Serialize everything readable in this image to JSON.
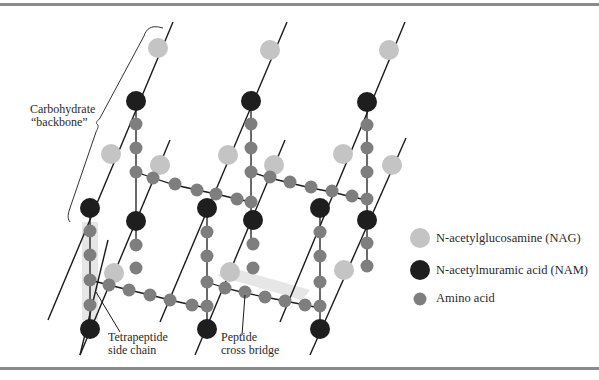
{
  "diagram": {
    "labels": {
      "backbone_line1": "Carbohydrate",
      "backbone_line2": "“backbone”",
      "tetrapeptide_line1": "Tetrapeptide",
      "tetrapeptide_line2": "side chain",
      "crossbridge_line1": "Peptide",
      "crossbridge_line2": "cross bridge"
    },
    "legend": [
      {
        "key": "nag",
        "label": "N-acetylglucosamine (NAG)",
        "color": "#c4c4c4"
      },
      {
        "key": "nam",
        "label": "N-acetylmuramic acid (NAM)",
        "color": "#1e1e1e"
      },
      {
        "key": "amino",
        "label": "Amino acid",
        "color": "#7e7e7e"
      }
    ],
    "colors": {
      "nag": "#c4c4c4",
      "nam": "#1e1e1e",
      "amino": "#7e7e7e",
      "line": "#1a1a1a",
      "highlight": "#e6e6e6",
      "border": "#8a8a8a"
    }
  }
}
